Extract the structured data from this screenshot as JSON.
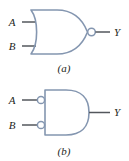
{
  "figure": {
    "colors": {
      "gate_outline": "#8496b0",
      "wire": "#53575c",
      "bubble_fill": "#ffffff",
      "text": "#1d1f22",
      "background": "#ffffff"
    },
    "panels": [
      {
        "id": "a",
        "caption": "(a)",
        "gate_type": "NOR",
        "gate_name": "nor-gate",
        "inverted_inputs": false,
        "inverted_output": true,
        "inputs": [
          {
            "label": "A",
            "name": "input-a"
          },
          {
            "label": "B",
            "name": "input-b"
          }
        ],
        "output": {
          "label": "Y",
          "name": "output-y"
        }
      },
      {
        "id": "b",
        "caption": "(b)",
        "gate_type": "AND with inverted inputs",
        "gate_name": "and-gate-inverted-inputs",
        "inverted_inputs": true,
        "inverted_output": false,
        "inputs": [
          {
            "label": "A",
            "name": "input-a"
          },
          {
            "label": "B",
            "name": "input-b"
          }
        ],
        "output": {
          "label": "Y",
          "name": "output-y"
        }
      }
    ]
  }
}
